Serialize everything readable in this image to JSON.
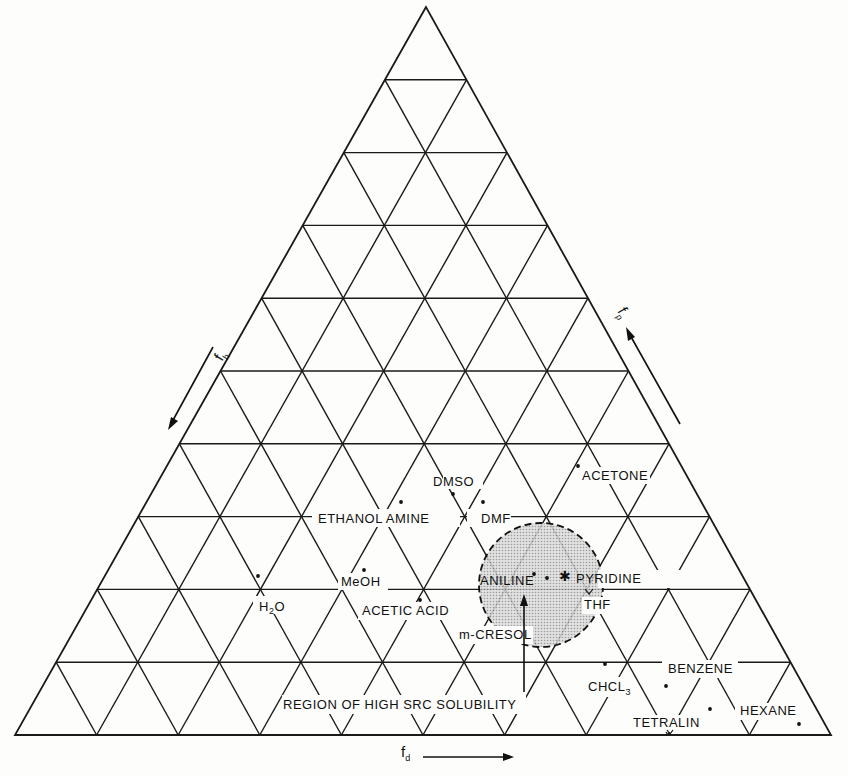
{
  "chart_data": {
    "type": "ternary",
    "title": "",
    "axes": {
      "bottom": {
        "label": "f_d",
        "direction": "left-to-right"
      },
      "left": {
        "label": "f_h",
        "direction": "top-to-bottom"
      },
      "right": {
        "label": "f_p",
        "direction": "bottom-to-top"
      }
    },
    "grid": {
      "divisions": 10,
      "on": true
    },
    "points": [
      {
        "name": "H2O",
        "label_x": 272,
        "label_y": 610,
        "dot": [
          258,
          576
        ]
      },
      {
        "name": "MeOH",
        "label_x": 363,
        "label_y": 585,
        "dot": [
          364,
          570
        ]
      },
      {
        "name": "ETHANOL AMINE",
        "label_x": 369,
        "label_y": 521,
        "dot": [
          401,
          502
        ]
      },
      {
        "name": "DMSO",
        "label_x": 451,
        "label_y": 486,
        "dot": [
          453,
          494
        ]
      },
      {
        "name": "DMF",
        "label_x": 498,
        "label_y": 521,
        "dot": [
          483,
          502
        ]
      },
      {
        "name": "ACETONE",
        "label_x": 616,
        "label_y": 479,
        "dot": [
          578,
          466
        ]
      },
      {
        "name": "ACETIC ACID",
        "label_x": 408,
        "label_y": 614,
        "dot": [
          420,
          600
        ]
      },
      {
        "name": "m-CRESOL",
        "label_x": 470,
        "label_y": 638,
        "dot": [
          534,
          574
        ]
      },
      {
        "name": "ANILINE",
        "label_x": 511,
        "label_y": 585,
        "dot": [
          547,
          578
        ]
      },
      {
        "name": "PYRIDINE",
        "label_x": 615,
        "label_y": 582,
        "dot": [
          564,
          574
        ]
      },
      {
        "name": "THF",
        "label_x": 596,
        "label_y": 607,
        "dot": [
          588,
          592
        ]
      },
      {
        "name": "CHCL3",
        "label_x": 608,
        "label_y": 689,
        "dot": [
          605,
          664
        ]
      },
      {
        "name": "BENZENE",
        "label_x": 700,
        "label_y": 672,
        "dot": [
          666,
          686
        ]
      },
      {
        "name": "TETRALIN",
        "label_x": 672,
        "label_y": 727,
        "dot": [
          710,
          709
        ]
      },
      {
        "name": "HEXANE",
        "label_x": 769,
        "label_y": 715,
        "dot": [
          799,
          724
        ]
      }
    ],
    "region": {
      "label": "REGION OF HIGH SRC SOLUBILITY",
      "shape": "circle",
      "center": [
        541,
        585
      ],
      "radius": 62,
      "fill": "#c8c8c8",
      "border": "dashed"
    }
  },
  "labels": {
    "h2o_main": "H",
    "h2o_sub": "2",
    "h2o_end": "O",
    "meoh": "MeOH",
    "ethanol_amine": "ETHANOL AMINE",
    "dmso": "DMSO",
    "dmf": "DMF",
    "acetone": "ACETONE",
    "acetic_acid": "ACETIC ACID",
    "m_cresol": "m-CRESOL",
    "aniline": "ANILINE",
    "pyridine": "PYRIDINE",
    "thf": "THF",
    "chcl_main": "CHCL",
    "chcl_sub": "3",
    "benzene": "BENZENE",
    "tetralin": "TETRALIN",
    "hexane": "HEXANE",
    "region": "REGION OF HIGH SRC SOLUBILITY",
    "axis_d": "f",
    "axis_d_sub": "d",
    "axis_h": "f",
    "axis_h_sub": "h",
    "axis_p": "f",
    "axis_p_sub": "p"
  }
}
